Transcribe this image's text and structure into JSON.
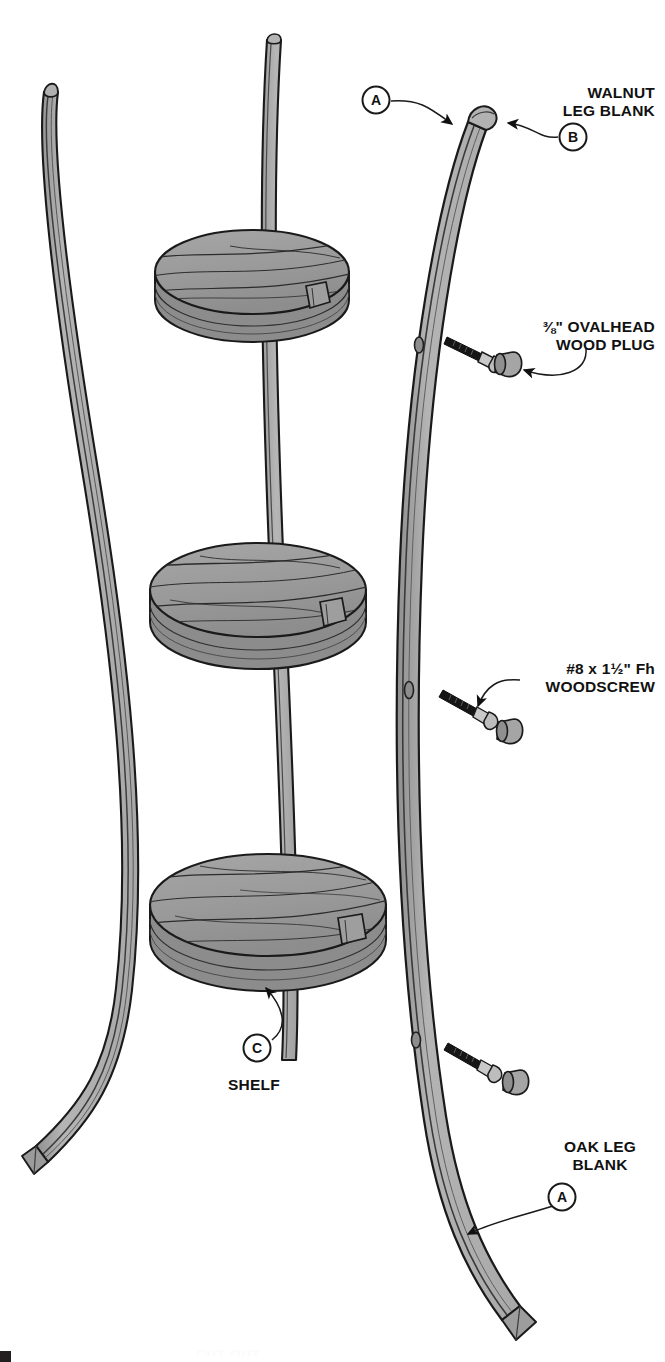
{
  "diagram": {
    "background_color": "#ffffff",
    "ink_color": "#111111",
    "colors": {
      "wood_face_light": "#b9b9b9",
      "wood_face_mid": "#a3a3a3",
      "shelf_top": "#9c9c9c",
      "shelf_edge": "#8e8e8e",
      "shelf_edge_dark": "#7f7f7f",
      "laminate_dark": "#4a4a4a",
      "metal_screw": "#1b1b1b",
      "outline": "#1a1a1a"
    },
    "callouts": [
      {
        "id": "walnut-leg-blank",
        "balloon": "B",
        "lines": [
          "WALNUT",
          "LEG BLANK"
        ],
        "text_x": 655,
        "text_y": 98,
        "align": "end",
        "balloon_x": 573,
        "balloon_y": 137
      },
      {
        "id": "oak-leg-blank-top",
        "balloon": "A",
        "lines": [],
        "balloon_x": 376,
        "balloon_y": 100
      },
      {
        "id": "ovalhead-wood-plug",
        "balloon": null,
        "lines": [
          "⅜\" OVALHEAD",
          "WOOD PLUG"
        ],
        "text_x": 655,
        "text_y": 332,
        "align": "end",
        "fraction": "3/8"
      },
      {
        "id": "woodscrew",
        "balloon": null,
        "lines": [
          "#8 x 1½\" Fh",
          "WOODSCREW"
        ],
        "text_x": 655,
        "text_y": 674,
        "align": "end"
      },
      {
        "id": "shelf",
        "balloon": "C",
        "lines": [
          "SHELF"
        ],
        "text_x": 255,
        "text_y": 1090,
        "align": "start",
        "balloon_x": 257,
        "balloon_y": 1048
      },
      {
        "id": "oak-leg-blank-bottom",
        "balloon": "A",
        "lines": [
          "OAK LEG",
          "BLANK"
        ],
        "text_x": 600,
        "text_y": 1170,
        "align": "middle",
        "balloon_x": 562,
        "balloon_y": 1197
      }
    ],
    "parts": [
      {
        "key": "A",
        "name": "OAK LEG BLANK"
      },
      {
        "key": "B",
        "name": "WALNUT LEG BLANK"
      },
      {
        "key": "C",
        "name": "SHELF"
      }
    ],
    "hardware": [
      {
        "name": "#8 x 1½\" Fh WOODSCREW",
        "count": 3
      },
      {
        "name": "⅜\" OVALHEAD WOOD PLUG",
        "count": 3
      }
    ],
    "assembly": {
      "shelves": 3,
      "legs_visible_left": 2,
      "leg_blank_right": 1,
      "screw_holes_in_leg": 3
    },
    "page_artifact": {
      "cropped_text": "CUT OUT",
      "corner_mark": true
    }
  }
}
